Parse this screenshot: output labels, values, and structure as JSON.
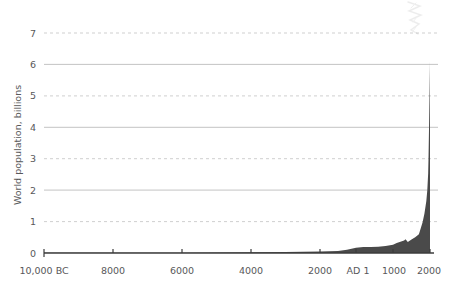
{
  "chart_data": {
    "type": "area",
    "title": "",
    "subtitle": "",
    "xlabel": "",
    "ylabel": "World population, billions",
    "ylim": [
      0,
      7
    ],
    "xlim": [
      -10000,
      2000
    ],
    "grid": true,
    "legend": null,
    "legend_position": "none",
    "series_color": "#4a4a4a",
    "background_color": "#ffffff",
    "gridline_solid_color": "#bcbcbc",
    "gridline_dashed_color": "#c9c9c9",
    "axis_color": "#3c3c3c",
    "y_ticks": [
      {
        "value": 7,
        "label": "7",
        "style": "dashed"
      },
      {
        "value": 6,
        "label": "6",
        "style": "solid"
      },
      {
        "value": 5,
        "label": "5",
        "style": "dashed"
      },
      {
        "value": 4,
        "label": "4",
        "style": "solid"
      },
      {
        "value": 3,
        "label": "3",
        "style": "dashed"
      },
      {
        "value": 2,
        "label": "2",
        "style": "solid"
      },
      {
        "value": 1,
        "label": "1",
        "style": "dashed"
      },
      {
        "value": 0,
        "label": "0",
        "style": "axis"
      }
    ],
    "x_ticks": [
      {
        "value": -10000,
        "label": "10,000 BC",
        "px": 44
      },
      {
        "value": -8000,
        "label": "8000",
        "px": 113
      },
      {
        "value": -6000,
        "label": "6000",
        "px": 182
      },
      {
        "value": -4000,
        "label": "4000",
        "px": 251
      },
      {
        "value": -2000,
        "label": "2000",
        "px": 320
      },
      {
        "value": 1,
        "label": "AD 1",
        "px": 356
      },
      {
        "value": 1000,
        "label": "1000",
        "px": 393
      },
      {
        "value": 2000,
        "label": "2000",
        "px": 430
      }
    ],
    "x": [
      -10000,
      -9000,
      -8000,
      -7000,
      -6000,
      -5000,
      -4000,
      -3000,
      -2000,
      -1000,
      -500,
      1,
      200,
      400,
      600,
      800,
      1000,
      1100,
      1200,
      1300,
      1340,
      1400,
      1500,
      1600,
      1650,
      1700,
      1750,
      1800,
      1850,
      1900,
      1927,
      1950,
      1960,
      1974,
      1987,
      1999,
      2000
    ],
    "values": [
      0.004,
      0.005,
      0.005,
      0.007,
      0.01,
      0.015,
      0.02,
      0.03,
      0.05,
      0.065,
      0.1,
      0.17,
      0.19,
      0.19,
      0.2,
      0.22,
      0.265,
      0.32,
      0.36,
      0.4,
      0.44,
      0.35,
      0.43,
      0.5,
      0.55,
      0.6,
      0.79,
      0.98,
      1.26,
      1.65,
      2.0,
      2.52,
      3.02,
      4.0,
      5.0,
      6.0,
      6.1
    ],
    "units": "billions",
    "peak_value": 6.1,
    "peak_label": "2000"
  },
  "decorations": {
    "watermark_icon": "faint-scribble-artifact"
  }
}
